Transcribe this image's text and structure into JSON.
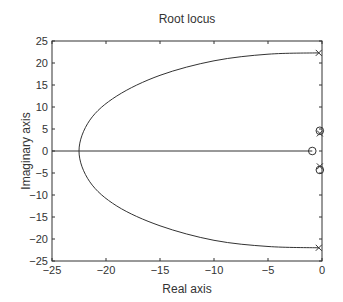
{
  "chart_data": {
    "type": "line",
    "title": "Root locus",
    "xlabel": "Real axis",
    "ylabel": "Imaginary axis",
    "xlim": [
      -25,
      0
    ],
    "ylim": [
      -25,
      25
    ],
    "xticks": [
      -25,
      -20,
      -15,
      -10,
      -5,
      0
    ],
    "yticks": [
      -25,
      -20,
      -15,
      -10,
      -5,
      0,
      5,
      10,
      15,
      20,
      25
    ],
    "xtick_labels": [
      "−25",
      "−20",
      "−15",
      "−10",
      "−5",
      "0"
    ],
    "ytick_labels": [
      "−25",
      "−20",
      "−15",
      "−10",
      "−5",
      "0",
      "5",
      "10",
      "15",
      "20",
      "25"
    ],
    "grid": false,
    "legend": null,
    "poles": [
      {
        "re": -0.3,
        "im": 22.3
      },
      {
        "re": -0.3,
        "im": -22.0
      },
      {
        "re": -0.2,
        "im": 4.0
      },
      {
        "re": -0.2,
        "im": -3.5
      }
    ],
    "zeros": [
      {
        "re": -0.9,
        "im": 0
      },
      {
        "re": -0.2,
        "im": 4.6
      },
      {
        "re": -0.2,
        "im": -4.3
      }
    ],
    "series": [
      {
        "name": "complex branch",
        "points": [
          [
            -0.3,
            22.3
          ],
          [
            -5,
            22.0
          ],
          [
            -10,
            20.5
          ],
          [
            -15,
            17.2
          ],
          [
            -19,
            12.5
          ],
          [
            -21.5,
            7
          ],
          [
            -22.5,
            0
          ],
          [
            -21.5,
            -7
          ],
          [
            -19,
            -12.5
          ],
          [
            -15,
            -17
          ],
          [
            -10,
            -20.3
          ],
          [
            -5,
            -21.7
          ],
          [
            -0.3,
            -22.0
          ]
        ]
      },
      {
        "name": "real-axis branch",
        "points": [
          [
            -0.9,
            0
          ],
          [
            -25,
            0
          ]
        ]
      }
    ]
  }
}
